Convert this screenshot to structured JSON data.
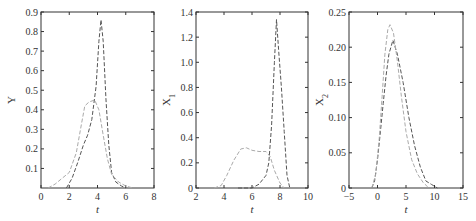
{
  "chart_data": [
    {
      "type": "line",
      "title": "",
      "xlabel": "t",
      "ylabel": "Y",
      "xlim": [
        0,
        8
      ],
      "ylim": [
        0,
        0.9
      ],
      "xticks": [
        0,
        2,
        4,
        6,
        8
      ],
      "yticks": [
        0.1,
        0.2,
        0.3,
        0.4,
        0.5,
        0.6,
        0.7,
        0.8,
        0.9
      ],
      "ytick_labels": [
        "0.1",
        "0.2",
        "0.3",
        "0.4",
        "0.5",
        "0.6",
        "0.7",
        "0.8",
        "0.9"
      ],
      "grid": false,
      "frame": {
        "x": 41,
        "y": 12,
        "w": 113,
        "h": 176
      },
      "series": [
        {
          "name": "series-1",
          "style": "dashed",
          "color": "#555555",
          "x": [
            1.8,
            2.2,
            2.6,
            3.0,
            3.3,
            3.6,
            3.9,
            4.1,
            4.25,
            4.4,
            4.6,
            4.8,
            5.0,
            5.3,
            5.7,
            6.0
          ],
          "y": [
            0.0,
            0.05,
            0.13,
            0.22,
            0.27,
            0.35,
            0.52,
            0.75,
            0.86,
            0.75,
            0.45,
            0.22,
            0.08,
            0.03,
            0.01,
            0.0
          ]
        },
        {
          "name": "series-2",
          "style": "dashed",
          "color": "#aaaaaa",
          "x": [
            0.5,
            1.0,
            1.5,
            2.0,
            2.5,
            2.8,
            3.1,
            3.4,
            3.8,
            4.1,
            4.4,
            4.7,
            5.0,
            5.5,
            6.0,
            6.5
          ],
          "y": [
            0.0,
            0.02,
            0.05,
            0.08,
            0.18,
            0.3,
            0.42,
            0.44,
            0.45,
            0.4,
            0.27,
            0.15,
            0.07,
            0.03,
            0.01,
            0.0
          ]
        }
      ]
    },
    {
      "type": "line",
      "title": "",
      "xlabel": "t",
      "ylabel": "X1",
      "xlim": [
        2,
        10
      ],
      "ylim": [
        0,
        1.4
      ],
      "xticks": [
        2,
        4,
        6,
        8,
        10
      ],
      "yticks": [
        0,
        0.2,
        0.4,
        0.6,
        0.8,
        1.0,
        1.2,
        1.4
      ],
      "ytick_labels": [
        "0",
        "0.2",
        "0.4",
        "0.6",
        "0.8",
        "1.0",
        "1.2",
        "1.4"
      ],
      "grid": false,
      "frame": {
        "x": 196,
        "y": 12,
        "w": 112,
        "h": 176
      },
      "series": [
        {
          "name": "series-1",
          "style": "dashed",
          "color": "#555555",
          "x": [
            5.0,
            6.0,
            6.5,
            7.0,
            7.2,
            7.4,
            7.6,
            7.75,
            7.9,
            8.1,
            8.3,
            8.5,
            8.7
          ],
          "y": [
            0.0,
            0.0,
            0.03,
            0.1,
            0.2,
            0.5,
            1.0,
            1.34,
            1.1,
            0.8,
            0.45,
            0.1,
            0.0
          ]
        },
        {
          "name": "series-2",
          "style": "dashed",
          "color": "#aaaaaa",
          "x": [
            3.3,
            3.8,
            4.2,
            4.7,
            5.2,
            5.6,
            6.0,
            6.5,
            7.0,
            7.3,
            7.6,
            8.0,
            8.3
          ],
          "y": [
            0.0,
            0.02,
            0.1,
            0.22,
            0.31,
            0.32,
            0.3,
            0.29,
            0.29,
            0.25,
            0.14,
            0.04,
            0.0
          ]
        }
      ]
    },
    {
      "type": "line",
      "title": "",
      "xlabel": "t",
      "ylabel": "X2",
      "xlim": [
        -5,
        15
      ],
      "ylim": [
        0,
        0.25
      ],
      "xticks": [
        -5,
        0,
        5,
        10,
        15
      ],
      "xtick_labels": [
        "−5",
        "0",
        "5",
        "10",
        "15"
      ],
      "yticks": [
        0,
        0.05,
        0.1,
        0.15,
        0.2,
        0.25
      ],
      "ytick_labels": [
        "0",
        "0.05",
        "0.10",
        "0.15",
        "0.20",
        "0.25"
      ],
      "grid": false,
      "frame": {
        "x": 349,
        "y": 12,
        "w": 114,
        "h": 176
      },
      "series": [
        {
          "name": "series-1",
          "style": "dashed",
          "color": "#555555",
          "x": [
            -1.0,
            -0.5,
            0.0,
            0.5,
            1.0,
            1.5,
            2.0,
            2.7,
            3.5,
            4.5,
            5.5,
            6.5,
            7.5,
            8.5,
            9.5,
            10.5
          ],
          "y": [
            0.0,
            0.01,
            0.04,
            0.08,
            0.12,
            0.16,
            0.19,
            0.21,
            0.19,
            0.15,
            0.1,
            0.06,
            0.03,
            0.01,
            0.005,
            0.0
          ]
        },
        {
          "name": "series-2",
          "style": "dashed",
          "color": "#aaaaaa",
          "x": [
            -1.0,
            -0.3,
            0.3,
            0.8,
            1.3,
            1.8,
            2.2,
            2.8,
            3.5,
            4.2,
            5.0,
            6.0,
            7.0,
            8.0,
            9.0
          ],
          "y": [
            0.0,
            0.02,
            0.07,
            0.13,
            0.19,
            0.225,
            0.232,
            0.22,
            0.18,
            0.13,
            0.08,
            0.04,
            0.02,
            0.008,
            0.0
          ]
        }
      ]
    }
  ]
}
